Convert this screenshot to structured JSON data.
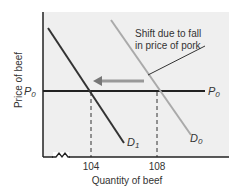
{
  "diagram": {
    "type": "supply-demand",
    "y_axis_label": "Price of beef",
    "x_axis_label": "Quantity of beef",
    "price_line_label_left": "P",
    "price_line_label_left_sub": "0",
    "price_line_label_right": "P",
    "price_line_label_right_sub": "0",
    "curves": [
      {
        "name": "D",
        "sub": "1",
        "color": "#333333"
      },
      {
        "name": "D",
        "sub": "0",
        "color": "#aaaaaa"
      }
    ],
    "x_ticks": [
      "104",
      "108"
    ],
    "annotation_line1": "Shift due to fall",
    "annotation_line2": "in price of pork",
    "colors": {
      "plot_bg": "#efefef",
      "axis": "#222222",
      "arrow": "#999999"
    }
  }
}
